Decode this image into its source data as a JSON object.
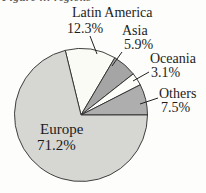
{
  "figure": {
    "clipped_caption": "Figure … regions"
  },
  "chart_data": {
    "type": "pie",
    "title": "",
    "categories": [
      "Latin America",
      "Asia",
      "Oceania",
      "Others",
      "Europe"
    ],
    "values": [
      12.3,
      5.9,
      3.1,
      7.5,
      71.2
    ],
    "slices": [
      {
        "label": "Latin America",
        "value": 12.3,
        "pct_label": "12.3%",
        "color": "#fbfbf5"
      },
      {
        "label": "Asia",
        "value": 5.9,
        "pct_label": "5.9%",
        "color": "#a5a5a5"
      },
      {
        "label": "Oceania",
        "value": 3.1,
        "pct_label": "3.1%",
        "color": "#fdfdfa"
      },
      {
        "label": "Others",
        "value": 7.5,
        "pct_label": "7.5%",
        "color": "#aeaeae"
      },
      {
        "label": "Europe",
        "value": 71.2,
        "pct_label": "71.2%",
        "color": "#d6d6d3"
      }
    ],
    "start_angle_deg": -13.7,
    "direction": "clockwise",
    "outline_color": "#2b2b2b",
    "leader_line_color": "#222222",
    "legend_position": "callout-labels",
    "labels_outside_with_leader_lines": [
      "Latin America",
      "Asia",
      "Oceania",
      "Others"
    ],
    "labels_inside": [
      "Europe"
    ]
  }
}
